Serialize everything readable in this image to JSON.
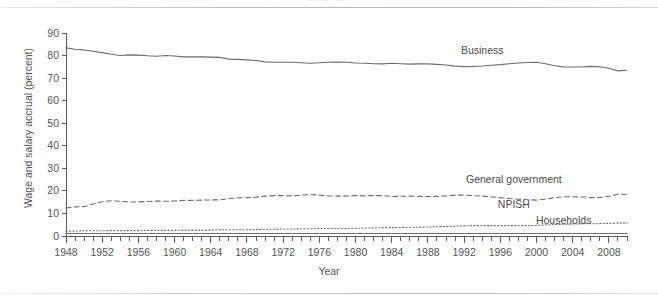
{
  "figure": {
    "caption_remnant": "(percent)",
    "xtitle": "Year",
    "ytitle": "Wage and salary accrual (percent)"
  },
  "labels": {
    "business": "Business",
    "general_government": "General government",
    "npish": "NPISH",
    "households": "Households"
  },
  "chart_data": {
    "type": "line",
    "title": "",
    "xlabel": "Year",
    "ylabel": "Wage and salary accrual (percent)",
    "xlim": [
      1948,
      2010
    ],
    "ylim": [
      0,
      90
    ],
    "ytick_labels": [
      "0",
      "10",
      "20",
      "30",
      "40",
      "50",
      "60",
      "70",
      "80",
      "90"
    ],
    "yticks": [
      0,
      10,
      20,
      30,
      40,
      50,
      60,
      70,
      80,
      90
    ],
    "xtick_labels": [
      "1948",
      "1952",
      "1956",
      "1960",
      "1964",
      "1968",
      "1972",
      "1976",
      "1980",
      "1984",
      "1988",
      "1992",
      "1996",
      "2000",
      "2004",
      "2008"
    ],
    "xticks": [
      1948,
      1952,
      1956,
      1960,
      1964,
      1968,
      1972,
      1976,
      1980,
      1984,
      1988,
      1992,
      1996,
      2000,
      2004,
      2008
    ],
    "minor_xtick_interval": 1,
    "grid": false,
    "legend_position": "inline-annotations",
    "x": [
      1948,
      1949,
      1950,
      1951,
      1952,
      1953,
      1954,
      1955,
      1956,
      1957,
      1958,
      1959,
      1960,
      1961,
      1962,
      1963,
      1964,
      1965,
      1966,
      1967,
      1968,
      1969,
      1970,
      1971,
      1972,
      1973,
      1974,
      1975,
      1976,
      1977,
      1978,
      1979,
      1980,
      1981,
      1982,
      1983,
      1984,
      1985,
      1986,
      1987,
      1988,
      1989,
      1990,
      1991,
      1992,
      1993,
      1994,
      1995,
      1996,
      1997,
      1998,
      1999,
      2000,
      2001,
      2002,
      2003,
      2004,
      2005,
      2006,
      2007,
      2008,
      2009,
      2010
    ],
    "series": [
      {
        "name": "Business",
        "style": "solid",
        "values": [
          83.4,
          82.8,
          82.5,
          81.9,
          81.3,
          80.6,
          80.0,
          80.3,
          80.2,
          79.9,
          79.7,
          80.0,
          79.8,
          79.4,
          79.5,
          79.4,
          79.3,
          79.2,
          78.4,
          78.3,
          78.1,
          77.8,
          77.2,
          77.0,
          77.0,
          77.0,
          76.8,
          76.6,
          76.8,
          77.0,
          77.1,
          77.0,
          76.7,
          76.6,
          76.4,
          76.3,
          76.6,
          76.4,
          76.2,
          76.3,
          76.3,
          76.1,
          75.8,
          75.3,
          75.1,
          75.2,
          75.4,
          75.7,
          76.0,
          76.4,
          76.7,
          76.9,
          77.0,
          76.4,
          75.5,
          75.0,
          74.9,
          74.9,
          75.2,
          75.0,
          74.4,
          73.2,
          73.5
        ]
      },
      {
        "name": "General government",
        "style": "dashed",
        "values": [
          12.4,
          12.9,
          13.0,
          14.2,
          15.2,
          15.6,
          15.4,
          15.1,
          15.1,
          15.3,
          15.5,
          15.4,
          15.5,
          15.8,
          15.8,
          15.9,
          16.0,
          16.0,
          16.6,
          16.9,
          17.0,
          17.2,
          17.7,
          17.9,
          17.9,
          17.8,
          18.1,
          18.4,
          18.1,
          17.8,
          17.7,
          17.7,
          17.9,
          17.8,
          17.9,
          17.9,
          17.5,
          17.6,
          17.7,
          17.6,
          17.5,
          17.6,
          17.8,
          18.1,
          18.1,
          17.9,
          17.7,
          17.4,
          17.0,
          16.6,
          16.3,
          16.1,
          15.9,
          16.3,
          17.0,
          17.4,
          17.4,
          17.3,
          17.0,
          17.1,
          17.6,
          18.6,
          18.3
        ]
      },
      {
        "name": "NPISH",
        "style": "dotted",
        "values": [
          2.1,
          2.2,
          2.3,
          2.3,
          2.3,
          2.4,
          2.4,
          2.4,
          2.4,
          2.5,
          2.5,
          2.5,
          2.5,
          2.6,
          2.6,
          2.6,
          2.6,
          2.7,
          2.8,
          2.8,
          2.8,
          2.9,
          3.0,
          3.0,
          3.1,
          3.1,
          3.2,
          3.2,
          3.3,
          3.3,
          3.3,
          3.3,
          3.4,
          3.5,
          3.6,
          3.7,
          3.7,
          3.8,
          3.9,
          3.9,
          4.0,
          4.1,
          4.2,
          4.4,
          4.5,
          4.6,
          4.6,
          4.6,
          4.6,
          4.6,
          4.6,
          4.6,
          4.7,
          4.9,
          5.1,
          5.2,
          5.3,
          5.4,
          5.4,
          5.5,
          5.6,
          5.8,
          5.8
        ]
      },
      {
        "name": "Households",
        "style": "solid-thin",
        "values": [
          1.1,
          1.1,
          1.1,
          1.1,
          1.1,
          1.1,
          1.1,
          1.1,
          1.1,
          1.1,
          1.1,
          1.1,
          1.1,
          1.1,
          1.1,
          1.1,
          1.1,
          1.1,
          1.1,
          1.1,
          1.1,
          1.1,
          1.1,
          1.1,
          1.1,
          1.1,
          1.1,
          1.1,
          1.1,
          1.1,
          1.1,
          1.1,
          1.1,
          1.1,
          1.1,
          1.1,
          1.1,
          1.1,
          1.1,
          1.1,
          1.1,
          1.1,
          1.1,
          1.1,
          1.1,
          1.1,
          1.1,
          1.1,
          1.1,
          1.1,
          1.1,
          1.1,
          1.1,
          1.1,
          1.1,
          1.1,
          1.1,
          1.1,
          1.1,
          1.1,
          1.1,
          1.1,
          1.1
        ]
      }
    ],
    "annotations": [
      {
        "text": "Business",
        "x": 1994,
        "y": 80.5
      },
      {
        "text": "General government",
        "x": 1997.5,
        "y": 23.5
      },
      {
        "text": "NPISH",
        "x": 1997.5,
        "y": 12.5
      },
      {
        "text": "Households",
        "x": 2003,
        "y": 5.5
      }
    ]
  },
  "colors": {
    "line": "#6b6b6b",
    "axis": "#5a5a5a",
    "text": "#555555",
    "background": "#ffffff"
  }
}
